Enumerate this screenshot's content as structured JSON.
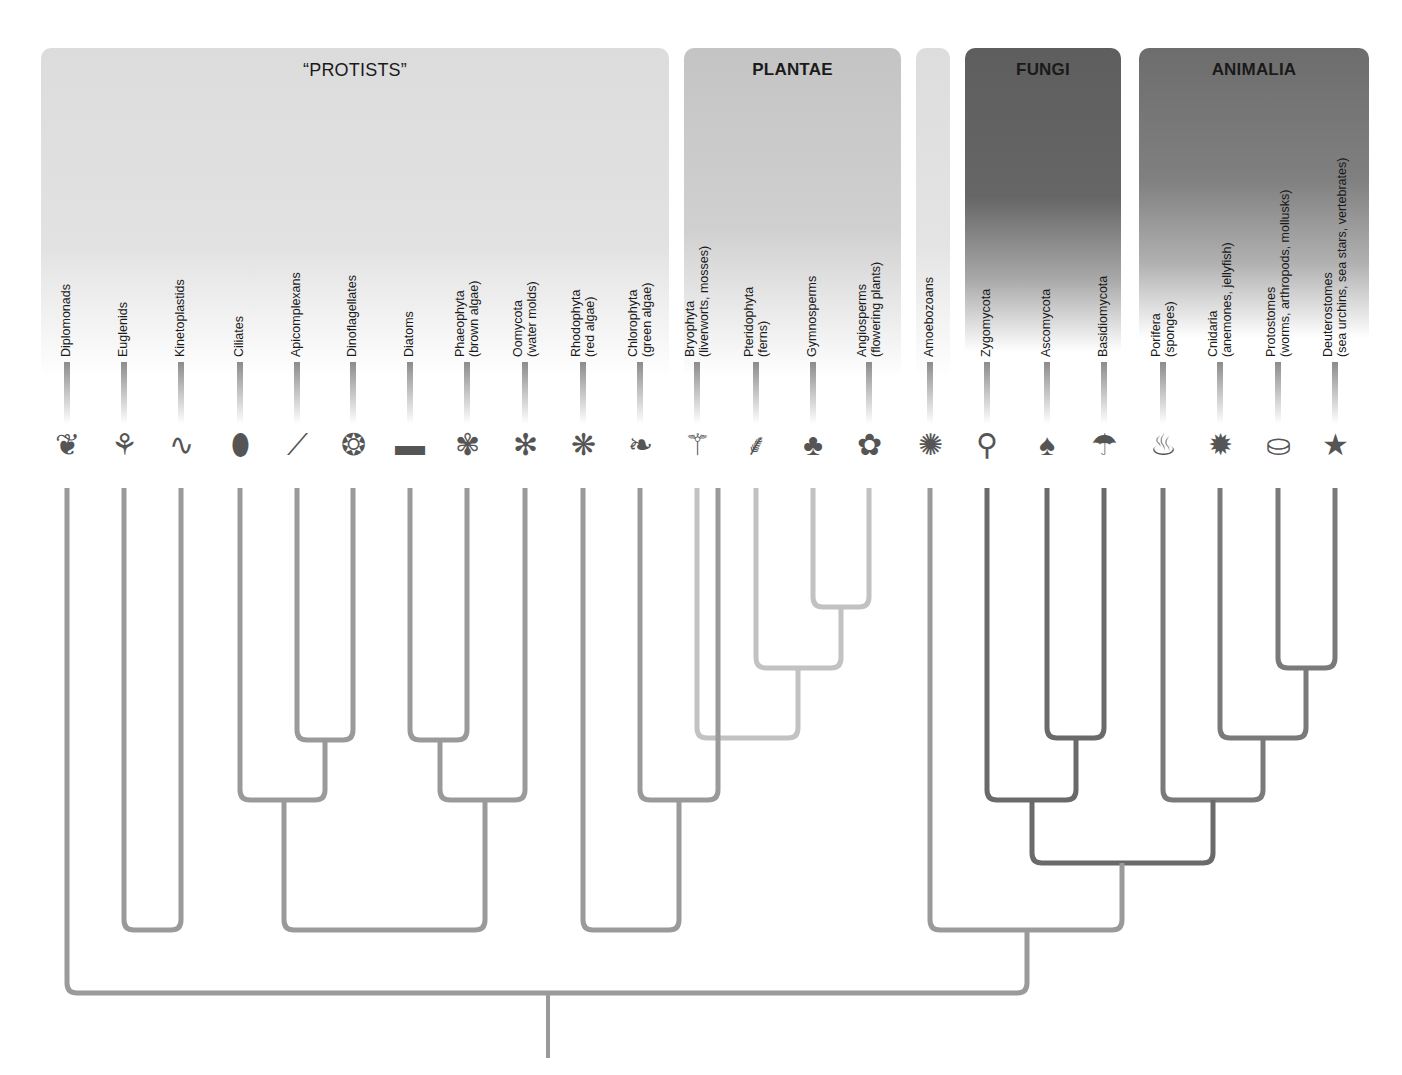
{
  "groups": {
    "protists": {
      "title": "“PROTISTS”"
    },
    "plantae": {
      "title": "PLANTAE"
    },
    "amoebozoa_band": {
      "title": ""
    },
    "fungi": {
      "title": "FUNGI"
    },
    "animalia": {
      "title": "ANIMALIA"
    }
  },
  "leaves": [
    {
      "name": "Diplomonads",
      "sub": "",
      "x": 67,
      "organism": "diplomonad"
    },
    {
      "name": "Euglenids",
      "sub": "",
      "x": 124,
      "organism": "euglena"
    },
    {
      "name": "Kinetoplastids",
      "sub": "",
      "x": 181,
      "organism": "trypanosome"
    },
    {
      "name": "Ciliates",
      "sub": "",
      "x": 240,
      "organism": "ciliate"
    },
    {
      "name": "Apicomplexans",
      "sub": "",
      "x": 297,
      "organism": "plasmodium"
    },
    {
      "name": "Dinoflagellates",
      "sub": "",
      "x": 353,
      "organism": "dinoflagellate"
    },
    {
      "name": "Diatoms",
      "sub": "",
      "x": 410,
      "organism": "diatom"
    },
    {
      "name": "Phaeophyta",
      "sub": "(brown algae)",
      "x": 467,
      "organism": "kelp"
    },
    {
      "name": "Oomycota",
      "sub": "(water molds)",
      "x": 525,
      "organism": "water-mold"
    },
    {
      "name": "Rhodophyta",
      "sub": "(red algae)",
      "x": 583,
      "organism": "red-alga"
    },
    {
      "name": "Chlorophyta",
      "sub": "(green algae)",
      "x": 640,
      "organism": "sea-lettuce"
    },
    {
      "name": "Bryophyta",
      "sub": "(liverworts, mosses)",
      "x": 697,
      "organism": "moss"
    },
    {
      "name": "Pteridophyta",
      "sub": "(ferns)",
      "x": 756,
      "organism": "fern"
    },
    {
      "name": "Gymnosperms",
      "sub": "",
      "x": 813,
      "organism": "pine-cone"
    },
    {
      "name": "Angiosperms",
      "sub": "(flowering plants)",
      "x": 869,
      "organism": "flower"
    },
    {
      "name": "Amoebozoans",
      "sub": "",
      "x": 930,
      "organism": "amoeba"
    },
    {
      "name": "Zygomycota",
      "sub": "",
      "x": 987,
      "organism": "bread-mold"
    },
    {
      "name": "Ascomycota",
      "sub": "",
      "x": 1047,
      "organism": "morel"
    },
    {
      "name": "Basidiomycota",
      "sub": "",
      "x": 1104,
      "organism": "mushroom"
    },
    {
      "name": "Porifera",
      "sub": "(sponges)",
      "x": 1163,
      "organism": "sponge"
    },
    {
      "name": "Cnidaria",
      "sub": "(anemones, jellyfish)",
      "x": 1220,
      "organism": "anemone"
    },
    {
      "name": "Protostomes",
      "sub": "(worms, arthropods, mollusks)",
      "x": 1278,
      "organism": "crab-worm-clam"
    },
    {
      "name": "Deuterostomes",
      "sub": "(sea urchins, sea stars, vertebrates)",
      "x": 1335,
      "organism": "salamander-urchin-starfish"
    }
  ],
  "colors": {
    "branch_default": "#9a9a9a",
    "branch_plants": "#c2c2c2",
    "branch_opisthokont": "#6a6a6a",
    "branch_animal": "#7a7a7a",
    "text": "#1a1a1a"
  },
  "clades": [
    {
      "id": "api-dino",
      "left": 297,
      "right": 353,
      "y": 740,
      "color": "branch_default"
    },
    {
      "id": "diatom-phaeo",
      "left": 410,
      "right": 467,
      "y": 740,
      "color": "branch_default"
    },
    {
      "id": "alveolate",
      "left": 240,
      "right": 325,
      "y": 800,
      "color": "branch_default"
    },
    {
      "id": "stramenopile",
      "left": 440,
      "right": 525,
      "y": 800,
      "color": "branch_default"
    },
    {
      "id": "chromalveolate",
      "left": 284,
      "right": 485,
      "y": 930,
      "color": "branch_default"
    },
    {
      "id": "euglenozoa",
      "left": 124,
      "right": 181,
      "y": 930,
      "color": "branch_default"
    },
    {
      "id": "seed-plants",
      "left": 813,
      "right": 869,
      "y": 607,
      "color": "branch_plants"
    },
    {
      "id": "vascular",
      "left": 756,
      "right": 841,
      "y": 668,
      "color": "branch_plants"
    },
    {
      "id": "land-plants",
      "left": 697,
      "right": 798,
      "y": 738,
      "color": "branch_plants"
    },
    {
      "id": "green-plants",
      "left": 640,
      "right": 718,
      "y": 800,
      "color": "branch_default"
    },
    {
      "id": "archaeplastida",
      "left": 583,
      "right": 679,
      "y": 930,
      "color": "branch_default"
    },
    {
      "id": "dikarya",
      "left": 1047,
      "right": 1104,
      "y": 738,
      "color": "branch_opisthokont"
    },
    {
      "id": "fungi-clade",
      "left": 987,
      "right": 1076,
      "y": 800,
      "color": "branch_opisthokont"
    },
    {
      "id": "bilateria",
      "left": 1278,
      "right": 1335,
      "y": 668,
      "color": "branch_animal"
    },
    {
      "id": "eumetazoa",
      "left": 1220,
      "right": 1306,
      "y": 738,
      "color": "branch_animal"
    },
    {
      "id": "metazoa",
      "left": 1163,
      "right": 1263,
      "y": 800,
      "color": "branch_animal"
    },
    {
      "id": "opisthokonta",
      "left": 1032,
      "right": 1213,
      "y": 863,
      "color": "branch_opisthokont"
    },
    {
      "id": "unikonta",
      "left": 930,
      "right": 1122,
      "y": 930,
      "color": "branch_default"
    },
    {
      "id": "root",
      "left": 67,
      "right": 1027,
      "y": 993,
      "color": "branch_default"
    }
  ],
  "root_stem": {
    "x": 548,
    "top": 993,
    "bottom": 1058
  }
}
